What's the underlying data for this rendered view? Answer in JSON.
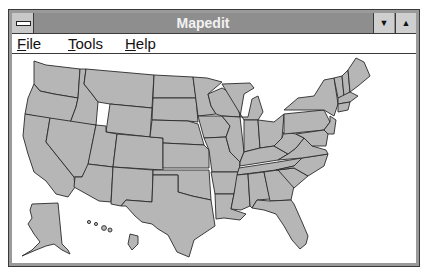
{
  "window": {
    "title": "Mapedit",
    "system_menu_icon": "system-menu-icon",
    "minimize_icon": "minimize-arrow-icon",
    "maximize_icon": "maximize-arrow-icon",
    "minimize_glyph": "▼",
    "maximize_glyph": "▲"
  },
  "menubar": {
    "items": [
      {
        "label": "File",
        "accel": "F",
        "rest": "ile"
      },
      {
        "label": "Tools",
        "accel": "T",
        "rest": "ools"
      },
      {
        "label": "Help",
        "accel": "H",
        "rest": "elp"
      }
    ]
  },
  "map": {
    "subject": "United States map with state boundaries",
    "includes": [
      "Contiguous United States",
      "Alaska",
      "Hawaii"
    ],
    "fill_color": "#b6b6b6",
    "border_color": "#2a2a2a"
  }
}
